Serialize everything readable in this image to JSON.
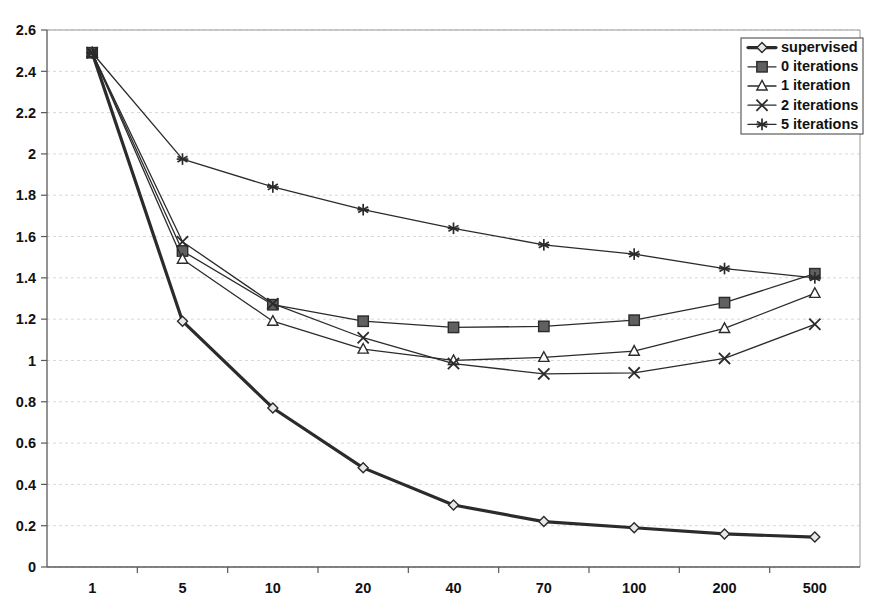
{
  "chart_data": {
    "type": "line",
    "title": "",
    "subtitle": "",
    "xlabel": "",
    "ylabel": "",
    "categories": [
      "1",
      "5",
      "10",
      "20",
      "40",
      "70",
      "100",
      "200",
      "500"
    ],
    "ylim": [
      0,
      2.6
    ],
    "ytick_step": 0.2,
    "yticks": [
      "0",
      "0.2",
      "0.4",
      "0.6",
      "0.8",
      "1",
      "1.2",
      "1.4",
      "1.6",
      "1.8",
      "2",
      "2.2",
      "2.4",
      "2.6"
    ],
    "grid": true,
    "grid_style": "horizontal-dotted",
    "legend_position": "top-right",
    "series": [
      {
        "name": "supervised",
        "marker": "diamond",
        "line_width": 3.2,
        "values": [
          2.49,
          1.19,
          0.77,
          0.48,
          0.3,
          0.22,
          0.19,
          0.16,
          0.145
        ]
      },
      {
        "name": "0 iterations",
        "marker": "square",
        "line_width": 1.3,
        "values": [
          2.49,
          1.53,
          1.27,
          1.19,
          1.16,
          1.165,
          1.195,
          1.28,
          1.42
        ]
      },
      {
        "name": "1 iteration",
        "marker": "triangle",
        "line_width": 1.3,
        "values": [
          2.49,
          1.49,
          1.19,
          1.055,
          1.0,
          1.015,
          1.045,
          1.155,
          1.325
        ]
      },
      {
        "name": "2 iterations",
        "marker": "x",
        "line_width": 1.3,
        "values": [
          2.49,
          1.575,
          1.275,
          1.11,
          0.985,
          0.935,
          0.94,
          1.01,
          1.175
        ]
      },
      {
        "name": "5 iterations",
        "marker": "star",
        "line_width": 1.3,
        "values": [
          2.49,
          1.975,
          1.84,
          1.73,
          1.64,
          1.56,
          1.515,
          1.445,
          1.4
        ]
      }
    ],
    "colors": {
      "line": "#2b2b2b",
      "grid": "#d8d8d8",
      "axis": "#5a5a5a",
      "marker_fill_dark": "#555555",
      "marker_fill_light": "#ffffff",
      "background": "#ffffff"
    }
  },
  "legend": {
    "entries": [
      {
        "label": "supervised"
      },
      {
        "label": "0 iterations"
      },
      {
        "label": "1 iteration"
      },
      {
        "label": "2 iterations"
      },
      {
        "label": "5 iterations"
      }
    ]
  }
}
